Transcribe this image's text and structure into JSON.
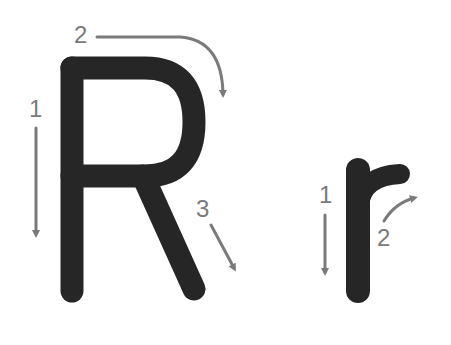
{
  "colors": {
    "background": "#ffffff",
    "letter": "#262626",
    "guide": "#7a7a7a"
  },
  "letters": [
    {
      "char": "R",
      "case": "uppercase",
      "strokes": [
        {
          "number": "1",
          "direction": "down",
          "description": "vertical stem"
        },
        {
          "number": "2",
          "direction": "right-and-around",
          "description": "bowl from top curving down"
        },
        {
          "number": "3",
          "direction": "diagonal-down-right",
          "description": "leg"
        }
      ]
    },
    {
      "char": "r",
      "case": "lowercase",
      "strokes": [
        {
          "number": "1",
          "direction": "down",
          "description": "vertical stem"
        },
        {
          "number": "2",
          "direction": "up-and-right",
          "description": "arch/arm"
        }
      ]
    }
  ]
}
